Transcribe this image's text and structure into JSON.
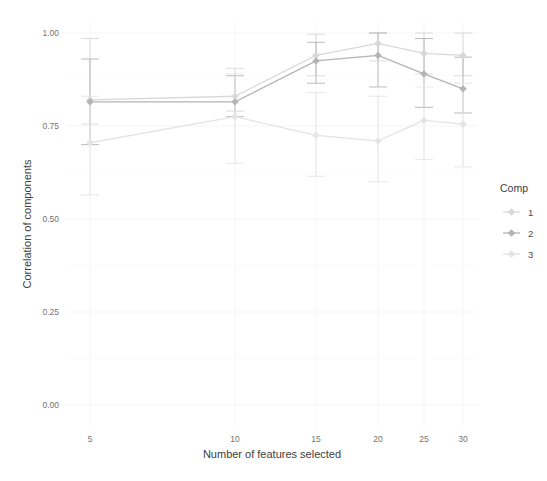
{
  "chart_data": {
    "type": "line",
    "title": "",
    "xlabel": "Number of features selected",
    "ylabel": "Correlation of components",
    "x": [
      5,
      10,
      15,
      20,
      25,
      30
    ],
    "xtick_labels": [
      "5",
      "10",
      "15",
      "20",
      "25",
      "30"
    ],
    "ytick_labels": [
      "0.00",
      "0.25",
      "0.50",
      "0.75",
      "1.00"
    ],
    "ylim": [
      0.0,
      1.0
    ],
    "ytick_values": [
      0.0,
      0.25,
      0.5,
      0.75,
      1.0
    ],
    "grid": true,
    "legend_position": "right",
    "legend_title": "Comp",
    "series": [
      {
        "name": "1",
        "label": "1",
        "color": "#d8d8d8",
        "values": [
          0.82,
          0.83,
          0.94,
          0.972,
          0.945,
          0.94
        ],
        "err_low": [
          0.755,
          0.79,
          0.885,
          0.925,
          0.89,
          0.885
        ],
        "err_high": [
          0.985,
          0.905,
          0.997,
          1.0,
          1.0,
          1.0
        ]
      },
      {
        "name": "2",
        "label": "2",
        "color": "#b4b4b4",
        "values": [
          0.815,
          0.815,
          0.925,
          0.94,
          0.89,
          0.85
        ],
        "err_low": [
          0.7,
          0.775,
          0.865,
          0.855,
          0.8,
          0.785
        ],
        "err_high": [
          0.93,
          0.885,
          0.975,
          1.0,
          0.985,
          0.935
        ]
      },
      {
        "name": "3",
        "label": "3",
        "color": "#e4e4e4",
        "values": [
          0.705,
          0.775,
          0.725,
          0.71,
          0.765,
          0.755
        ],
        "err_low": [
          0.565,
          0.65,
          0.615,
          0.6,
          0.66,
          0.64
        ],
        "err_high": [
          0.83,
          0.89,
          0.84,
          0.83,
          0.855,
          0.865
        ]
      }
    ]
  },
  "axes": {
    "y_axis_title": "Correlation of components",
    "x_axis_title": "Number of features selected"
  },
  "legend": {
    "title": "Comp",
    "items": [
      {
        "label": "1"
      },
      {
        "label": "2"
      },
      {
        "label": "3"
      }
    ]
  }
}
